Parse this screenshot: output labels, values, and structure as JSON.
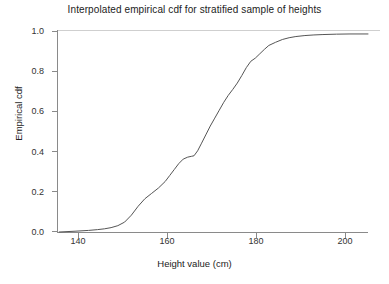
{
  "chart_data": {
    "type": "line",
    "title": "Interpolated empirical cdf for stratified sample of heights",
    "xlabel": "Height value (cm)",
    "ylabel": "Empirical cdf",
    "xlim": [
      136,
      205
    ],
    "ylim": [
      0.0,
      1.02
    ],
    "xticks": [
      140,
      160,
      180,
      200
    ],
    "xtick_labels": [
      "140",
      "160",
      "180",
      "200"
    ],
    "yticks": [
      0.0,
      0.2,
      0.4,
      0.6,
      0.8,
      1.0
    ],
    "ytick_labels": [
      "0.0",
      "0.2",
      "0.4",
      "0.6",
      "0.8",
      "1.0"
    ],
    "grid": false,
    "legend": "none",
    "line_color": "#555555",
    "background_color": "#ffffff",
    "series": [
      {
        "name": "Interpolated empirical cdf",
        "x": [
          136.5,
          140.0,
          143.0,
          145.0,
          146.5,
          148.0,
          149.5,
          151.0,
          152.5,
          154.0,
          155.5,
          157.0,
          158.5,
          160.0,
          161.0,
          162.0,
          163.0,
          164.0,
          165.0,
          165.8,
          166.4,
          167.2,
          168.0,
          169.0,
          170.0,
          171.0,
          172.0,
          173.0,
          174.0,
          175.0,
          176.0,
          177.0,
          178.0,
          179.0,
          180.0,
          181.0,
          182.0,
          183.0,
          184.5,
          186.0,
          187.5,
          189.0,
          191.0,
          193.0,
          195.0,
          198.0,
          201.0,
          205.0
        ],
        "y": [
          0.0,
          0.004,
          0.008,
          0.012,
          0.016,
          0.022,
          0.032,
          0.05,
          0.085,
          0.13,
          0.168,
          0.195,
          0.222,
          0.255,
          0.285,
          0.315,
          0.345,
          0.368,
          0.378,
          0.382,
          0.385,
          0.41,
          0.445,
          0.49,
          0.535,
          0.575,
          0.615,
          0.655,
          0.69,
          0.72,
          0.752,
          0.79,
          0.83,
          0.862,
          0.878,
          0.9,
          0.922,
          0.942,
          0.958,
          0.972,
          0.981,
          0.987,
          0.992,
          0.995,
          0.997,
          0.999,
          1.0,
          1.0
        ]
      }
    ]
  }
}
